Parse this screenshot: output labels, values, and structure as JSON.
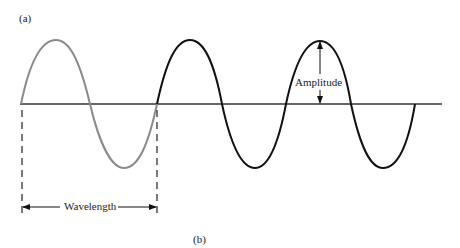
{
  "figure": {
    "panel_a_label": "(a)",
    "panel_b_label": "(b)",
    "wavelength_label": "Wavelength",
    "amplitude_label": "Amplitude"
  },
  "colors": {
    "first_cycle": "#8a8a8a",
    "later_cycles": "#111111",
    "axis": "#333333",
    "background": "#ffffff"
  },
  "wave": {
    "cycles_total": 3,
    "highlighted_cycles": 1,
    "description": "Sine wave; first cycle drawn in gray, following two cycles in black"
  }
}
